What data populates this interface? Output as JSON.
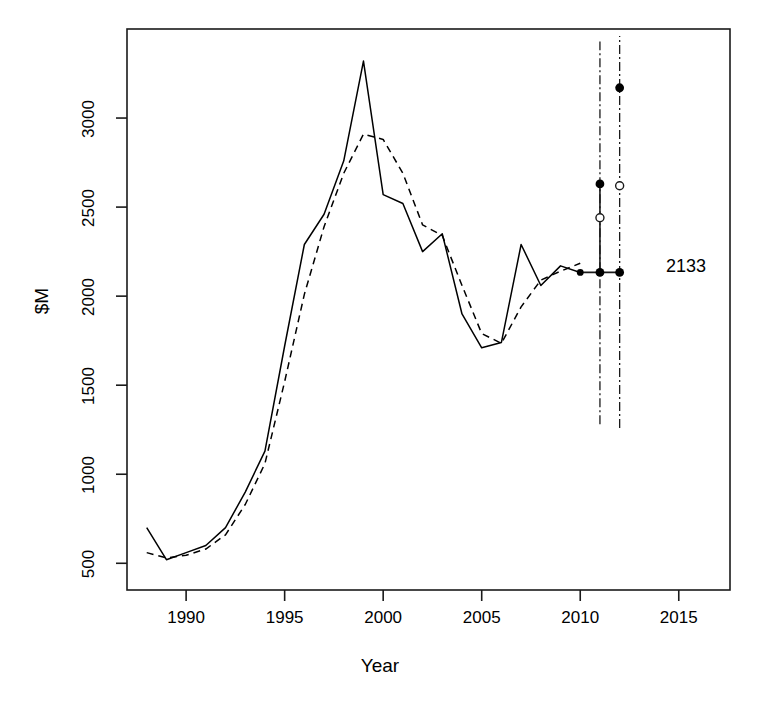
{
  "chart_data": {
    "type": "line",
    "title": "",
    "xlabel": "Year",
    "ylabel": "$M",
    "xlim": [
      1987.0,
      2017.6
    ],
    "ylim": [
      350,
      3500
    ],
    "xticks": [
      1990,
      1995,
      2000,
      2005,
      2010,
      2015
    ],
    "xtick_labels": [
      "1990",
      "1995",
      "2000",
      "2005",
      "2010",
      "2015"
    ],
    "yticks": [
      500,
      1000,
      1500,
      2000,
      2500,
      3000
    ],
    "ytick_labels": [
      "500",
      "1000",
      "1500",
      "2000",
      "2500",
      "3000"
    ],
    "grid": false,
    "legend": "none",
    "series": [
      {
        "name": "actual",
        "style": "solid",
        "color": "#000000",
        "x": [
          1988,
          1989,
          1990,
          1991,
          1992,
          1993,
          1994,
          1995,
          1996,
          1997,
          1998,
          1999,
          2000,
          2001,
          2002,
          2003,
          2004,
          2005,
          2006,
          2007,
          2008,
          2009,
          2010
        ],
        "y": [
          700,
          520,
          560,
          600,
          700,
          900,
          1130,
          1720,
          2290,
          2460,
          2760,
          3320,
          2570,
          2520,
          2250,
          2350,
          1900,
          1710,
          1740,
          2290,
          2060,
          2170,
          2133
        ]
      },
      {
        "name": "fitted",
        "style": "dashed",
        "color": "#000000",
        "x": [
          1988,
          1989,
          1990,
          1991,
          1992,
          1993,
          1994,
          1995,
          1996,
          1997,
          1998,
          1999,
          2000,
          2001,
          2002,
          2003,
          2004,
          2005,
          2006,
          2007,
          2008,
          2009,
          2010
        ],
        "y": [
          560,
          530,
          545,
          580,
          660,
          830,
          1060,
          1520,
          2010,
          2390,
          2690,
          2910,
          2880,
          2690,
          2400,
          2340,
          2060,
          1790,
          1735,
          1940,
          2090,
          2140,
          2185
        ]
      }
    ],
    "forecast": {
      "baseline_value": 2133,
      "baseline_label": "2133",
      "baseline_year_start": 2010,
      "baseline_year_end": 2012,
      "intervals": [
        {
          "year": 2011,
          "line_style": "dashdot",
          "low": 1280,
          "high": 3430,
          "points": [
            {
              "value": 2133,
              "marker": "filled"
            },
            {
              "value": 2440,
              "marker": "open"
            },
            {
              "value": 2630,
              "marker": "filled"
            }
          ]
        },
        {
          "year": 2012,
          "line_style": "dashdot",
          "low": 1260,
          "high": 3460,
          "points": [
            {
              "value": 2133,
              "marker": "filled"
            },
            {
              "value": 2620,
              "marker": "open"
            },
            {
              "value": 3170,
              "marker": "filled"
            }
          ]
        }
      ]
    }
  },
  "annotations": {
    "value_label": "2133"
  },
  "axes": {
    "x_title": "Year",
    "y_title": "$M"
  }
}
